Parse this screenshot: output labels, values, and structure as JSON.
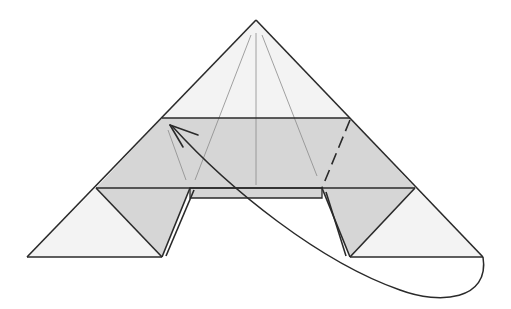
{
  "diagram": {
    "type": "origami-fold-step",
    "colors": {
      "background": "#ffffff",
      "paper_light": "#f2f2f2",
      "paper_shaded": "#d4d4d4",
      "line": "#2a2a2a",
      "crease": "#8a8a8a"
    },
    "elements": {
      "apex_triangle": "top-triangle",
      "middle_band": "shaded-band",
      "left_corner": "left-corner-triangle",
      "right_corner": "right-corner-triangle",
      "valley_fold": "dashed-fold-line",
      "fold_arrow": "curved-arrow"
    }
  }
}
